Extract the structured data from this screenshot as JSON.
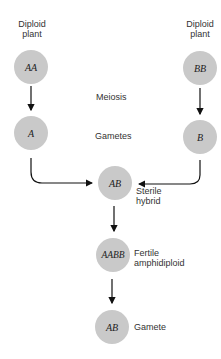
{
  "labels": {
    "left_parent": "Diploid plant",
    "left_parent_l1": "Diploid",
    "left_parent_l2": "plant",
    "right_parent_l1": "Diploid",
    "right_parent_l2": "plant",
    "meiosis": "Meiosis",
    "gametes": "Gametes",
    "hybrid_l1": "Sterile",
    "hybrid_l2": "hybrid",
    "amphi_l1": "Fertile",
    "amphi_l2": "amphidiploid",
    "gamete": "Gamete"
  },
  "nodes": {
    "parent_a": "AA",
    "parent_b": "BB",
    "gamete_a": "A",
    "gamete_b": "B",
    "hybrid": "AB",
    "amphidiploid": "AABB",
    "final_gamete": "AB"
  },
  "colors": {
    "circle": "#c9c9c9",
    "arrow": "#111111"
  }
}
